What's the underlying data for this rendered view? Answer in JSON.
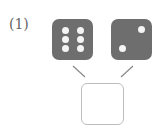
{
  "problem": {
    "number_label": "(1)",
    "dice": [
      {
        "value": 6,
        "pips": [
          [
            9,
            9
          ],
          [
            25,
            9
          ],
          [
            9,
            17
          ],
          [
            25,
            17
          ],
          [
            9,
            25
          ],
          [
            25,
            25
          ]
        ]
      },
      {
        "value": 2,
        "pips": [
          [
            26,
            7
          ],
          [
            8,
            25
          ]
        ]
      }
    ],
    "answer": "",
    "colors": {
      "die": "#6e6e6e",
      "pip": "#f4f4f4",
      "line": "#888888",
      "box_border": "#bdbdbd"
    }
  }
}
